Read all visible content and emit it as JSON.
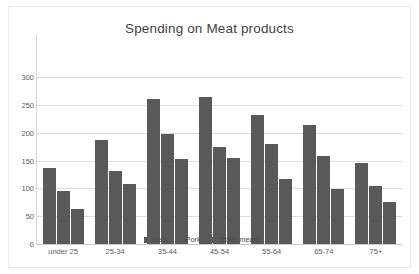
{
  "chart_data": {
    "type": "bar",
    "title": "Spending on Meat products",
    "xlabel": "",
    "ylabel": "",
    "categories": [
      "under 25",
      "25-34",
      "35-44",
      "45-54",
      "55-64",
      "65-74",
      "75+"
    ],
    "series": [
      {
        "name": "Beef",
        "values": [
          137,
          187,
          261,
          264,
          231,
          214,
          146
        ]
      },
      {
        "name": "Pork",
        "values": [
          96,
          131,
          198,
          175,
          179,
          158,
          105
        ]
      },
      {
        "name": "Other meats",
        "values": [
          63,
          108,
          153,
          154,
          116,
          98,
          75
        ]
      }
    ],
    "ylim": [
      0,
      300
    ],
    "ytick_labels": [
      "0",
      "50",
      "100",
      "150",
      "200",
      "250",
      "300"
    ],
    "ytick_values": [
      0,
      50,
      100,
      150,
      200,
      250,
      300
    ],
    "grid": true,
    "legend_position": "bottom-center-overlapping-plot",
    "bar_color": "#595959",
    "gridline_color": "#dcdcdc",
    "background_color": "#ffffff",
    "text_color": "#5c5c5c"
  }
}
